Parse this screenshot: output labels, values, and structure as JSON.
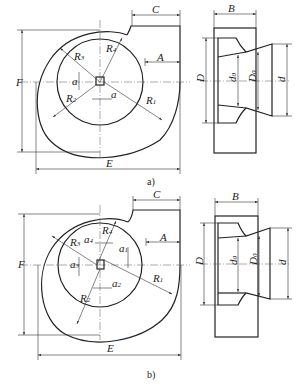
{
  "figure": {
    "views": [
      {
        "id": "a",
        "caption": "a)",
        "front_view_labels": {
          "radii": [
            "R1",
            "R2",
            "R3",
            "R4"
          ],
          "offsets": [
            "a",
            "a"
          ],
          "dimensions": [
            "A",
            "C",
            "E",
            "F"
          ]
        },
        "side_view_labels": {
          "dimensions": [
            "B",
            "D",
            "d0",
            "D0",
            "d"
          ]
        }
      },
      {
        "id": "b",
        "caption": "b)",
        "front_view_labels": {
          "radii": [
            "R1",
            "R2",
            "R3",
            "R4"
          ],
          "offsets": [
            "a1",
            "a2",
            "a3",
            "a4"
          ],
          "dimensions": [
            "A",
            "C",
            "E",
            "F"
          ]
        },
        "side_view_labels": {
          "dimensions": [
            "B",
            "D",
            "d0",
            "D0",
            "d"
          ]
        }
      }
    ]
  },
  "labels": {
    "A": "A",
    "B": "B",
    "C": "C",
    "D": "D",
    "E": "E",
    "F": "F",
    "R": "R",
    "a": "a",
    "d": "d",
    "s1": "1",
    "s2": "2",
    "s3": "3",
    "s4": "4",
    "s0": "0",
    "cap_a": "a)",
    "cap_b": "b)"
  }
}
